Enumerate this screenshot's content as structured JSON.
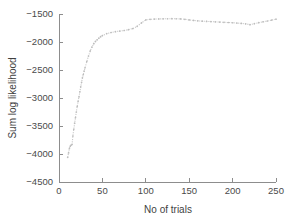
{
  "figure": {
    "background": "#ffffff",
    "series_color": "#c9c9c9",
    "axis_color": "#8d8d8d",
    "text_color": "#3f3f3f"
  },
  "chart_data": {
    "type": "line",
    "title": "",
    "subtitle": "",
    "xlabel": "No of trials",
    "ylabel": "Sum log likelihood",
    "xlim": [
      0,
      250
    ],
    "ylim": [
      -4500,
      -1500
    ],
    "xticks": [
      0,
      50,
      100,
      150,
      200,
      250
    ],
    "xticklabels": [
      "0",
      "50",
      "100",
      "150",
      "200",
      "250"
    ],
    "yticks": [
      -4500,
      -4000,
      -3500,
      -3000,
      -2500,
      -2000,
      -1500
    ],
    "yticklabels": [
      "-4500",
      "-4000",
      "-3500",
      "-3000",
      "-2500",
      "-2000",
      "-1500"
    ],
    "grid": false,
    "legend": null,
    "legend_position": "none",
    "linestyle": "dotted",
    "marker": "dot",
    "series": [
      {
        "name": "Sum log likelihood",
        "color": "#c9c9c9",
        "x": [
          10,
          11,
          12,
          13,
          14,
          15,
          16,
          17,
          18,
          19,
          20,
          21,
          22,
          23,
          24,
          25,
          26,
          27,
          28,
          29,
          30,
          32,
          34,
          36,
          38,
          40,
          42,
          44,
          46,
          48,
          50,
          55,
          60,
          65,
          70,
          75,
          80,
          85,
          90,
          95,
          100,
          105,
          110,
          115,
          120,
          125,
          130,
          135,
          140,
          145,
          150,
          155,
          160,
          165,
          170,
          175,
          180,
          185,
          190,
          195,
          200,
          205,
          210,
          215,
          220,
          225,
          230,
          235,
          240,
          245,
          250
        ],
        "y": [
          -4060,
          -3980,
          -3900,
          -3860,
          -3840,
          -3830,
          -3680,
          -3560,
          -3450,
          -3350,
          -3250,
          -3150,
          -3060,
          -2980,
          -2890,
          -2800,
          -2720,
          -2640,
          -2580,
          -2520,
          -2460,
          -2350,
          -2250,
          -2160,
          -2090,
          -2030,
          -1990,
          -1960,
          -1930,
          -1905,
          -1885,
          -1850,
          -1830,
          -1815,
          -1805,
          -1795,
          -1780,
          -1760,
          -1720,
          -1660,
          -1605,
          -1595,
          -1590,
          -1588,
          -1586,
          -1585,
          -1584,
          -1585,
          -1588,
          -1595,
          -1605,
          -1615,
          -1622,
          -1628,
          -1632,
          -1636,
          -1640,
          -1644,
          -1648,
          -1652,
          -1656,
          -1662,
          -1668,
          -1676,
          -1690,
          -1672,
          -1655,
          -1640,
          -1625,
          -1608,
          -1592
        ]
      }
    ]
  }
}
